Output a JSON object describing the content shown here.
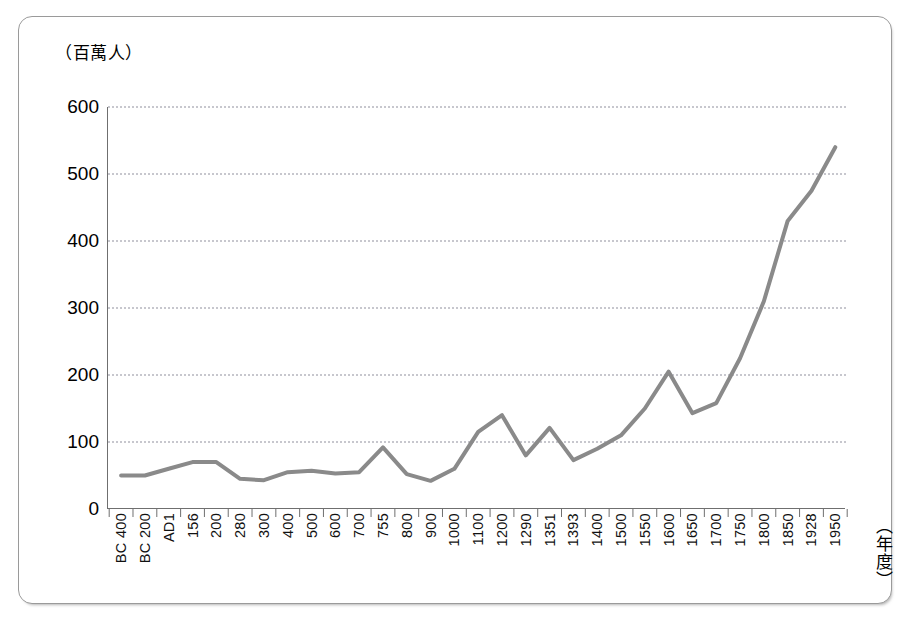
{
  "figure": {
    "units_caption": "（百萬人）",
    "x_axis_title": "（年度）",
    "footnote": ""
  },
  "chart_data": {
    "type": "line",
    "title": "",
    "subtitle": "",
    "xlabel": "（年度）",
    "ylabel": "（百萬人）",
    "ylim": [
      0,
      600
    ],
    "y_ticks": [
      0,
      100,
      200,
      300,
      400,
      500,
      600
    ],
    "grid": true,
    "grid_axis": "y",
    "legend": false,
    "legend_position": "none",
    "line_color": "#8a8a8a",
    "line_width": 4,
    "categories": [
      "BC 400",
      "BC 200",
      "AD1",
      "156",
      "200",
      "280",
      "300",
      "400",
      "500",
      "600",
      "700",
      "755",
      "800",
      "900",
      "1000",
      "1100",
      "1200",
      "1290",
      "1351",
      "1393",
      "1400",
      "1500",
      "1550",
      "1600",
      "1650",
      "1700",
      "1750",
      "1800",
      "1850",
      "1928",
      "1950"
    ],
    "values": [
      50,
      50,
      60,
      70,
      70,
      45,
      43,
      55,
      57,
      53,
      55,
      92,
      52,
      42,
      60,
      115,
      140,
      80,
      121,
      73,
      90,
      110,
      150,
      205,
      143,
      158,
      225,
      310,
      430,
      475,
      540
    ],
    "series": [
      {
        "name": "人口",
        "values": [
          50,
          50,
          60,
          70,
          70,
          45,
          43,
          55,
          57,
          53,
          55,
          92,
          52,
          42,
          60,
          115,
          140,
          80,
          121,
          73,
          90,
          110,
          150,
          205,
          143,
          158,
          225,
          310,
          430,
          475,
          540
        ]
      }
    ]
  }
}
